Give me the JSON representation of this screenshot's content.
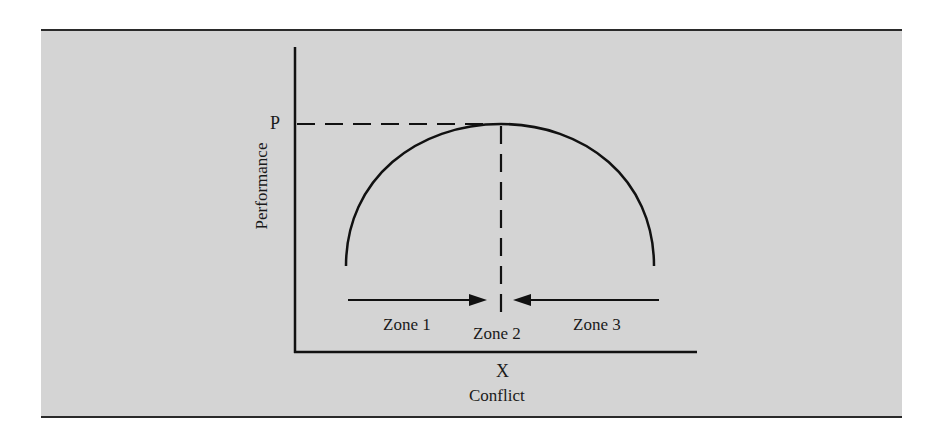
{
  "figure": {
    "type": "performance-vs-conflict curve",
    "y_axis": {
      "label": "Performance",
      "marker_label": "P"
    },
    "x_axis": {
      "label": "Conflict",
      "marker_label": "X"
    },
    "zones": [
      {
        "label": "Zone 1",
        "description": "low conflict, arrow pointing right toward optimum"
      },
      {
        "label": "Zone 2",
        "description": "optimal conflict level at X"
      },
      {
        "label": "Zone 3",
        "description": "high conflict, arrow pointing left toward optimum"
      }
    ],
    "curve": {
      "shape": "inverted-U / semicircle",
      "peak": {
        "x_label": "X",
        "y_label": "P"
      }
    },
    "colors": {
      "panel_background": "#d4d4d4",
      "line": "#111111",
      "text": "#1a1a1a",
      "rule": "#2a2a2a"
    }
  }
}
